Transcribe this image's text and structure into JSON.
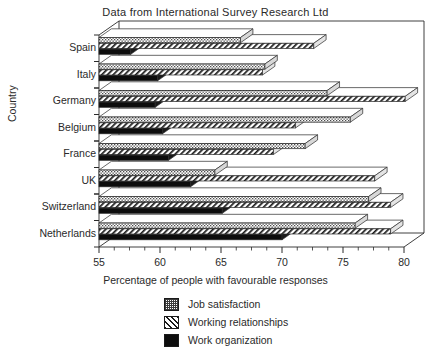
{
  "chart_data": {
    "type": "bar",
    "orientation": "horizontal",
    "style": "3d-ribbon",
    "title": "Data from International Survey Research Ltd",
    "xlabel": "Percentage of people with favourable responses",
    "ylabel": "Country",
    "xlim": [
      55,
      80
    ],
    "xticks": [
      55,
      60,
      65,
      70,
      75,
      80
    ],
    "xminorticks": [
      56.25,
      57.5,
      58.75,
      61.25,
      62.5,
      63.75,
      66.25,
      67.5,
      68.75,
      71.25,
      72.5,
      73.75,
      76.25,
      77.5,
      78.75
    ],
    "grid": false,
    "legend_position": "below-axis",
    "categories": [
      "Spain",
      "Italy",
      "Germany",
      "Belgium",
      "France",
      "UK",
      "Switzerland",
      "Netherlands"
    ],
    "series": [
      {
        "name": "Job satisfaction",
        "pattern": "dotted",
        "color": "#ffffff",
        "values": [
          66.6,
          68.6,
          73.7,
          75.6,
          71.9,
          64.5,
          77.1,
          76.0
        ]
      },
      {
        "name": "Working relationships",
        "pattern": "diagonal-hatch",
        "color": "#ffffff",
        "values": [
          72.6,
          68.4,
          80.1,
          71.1,
          69.3,
          77.6,
          78.9,
          78.9
        ]
      },
      {
        "name": "Work organization",
        "pattern": "solid-black",
        "color": "#0d0d0d",
        "values": [
          57.6,
          59.8,
          59.6,
          60.2,
          60.7,
          62.5,
          65.1,
          70.0
        ]
      }
    ]
  },
  "legend": {
    "items": [
      {
        "label": "Job satisfaction",
        "swatch": "dotted-swatch-icon"
      },
      {
        "label": "Working relationships",
        "swatch": "diagonal-hatch-swatch-icon"
      },
      {
        "label": "Work organization",
        "swatch": "solid-black-swatch-icon"
      }
    ]
  }
}
